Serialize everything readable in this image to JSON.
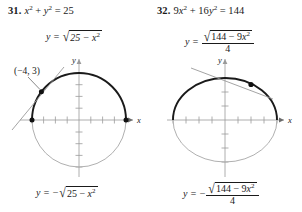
{
  "page": {
    "background": "#ffffff",
    "ink": "#1a1a1a",
    "muted_curve_color": "#a9a9a9",
    "bold_curve_color": "#1a1a1a"
  },
  "problems": [
    {
      "number": "31.",
      "equation": {
        "lhs_var1": "x",
        "exp1": "2",
        "plus": "+",
        "lhs_var2": "y",
        "exp2": "2",
        "equals": "=",
        "rhs": "25",
        "full": "x² + y² = 25"
      },
      "top_function": {
        "lhs": "y  =",
        "radical_sign": "√",
        "radicand": "25 − x²",
        "full": "y = √(25 − x²)"
      },
      "bottom_function": {
        "lhs": "y  =",
        "minus": "−",
        "radical_sign": "√",
        "radicand": "25 − x²",
        "full": "y = −√(25 − x²)"
      },
      "point_label": {
        "open": "(",
        "x": "−4,",
        "y": "3",
        "close": ")",
        "full": "(−4, 3)"
      },
      "axis_labels": {
        "x": "x",
        "y": "y"
      },
      "curve": {
        "type": "circle",
        "radius": 5,
        "center": [
          0,
          0
        ],
        "upper_half": "bold",
        "lower_half": "light",
        "marked_points": [
          [
            -5,
            0
          ],
          [
            5,
            0
          ],
          [
            -4,
            3
          ]
        ],
        "tangent_at": [
          -4,
          3
        ]
      }
    },
    {
      "number": "32.",
      "equation": {
        "coef1": "9",
        "lhs_var1": "x",
        "exp1": "2",
        "plus": "+",
        "coef2": "16",
        "lhs_var2": "y",
        "exp2": "2",
        "equals": "=",
        "rhs": "144",
        "full": "9x² + 16y² = 144"
      },
      "top_function": {
        "lhs": "y  =",
        "radical_sign": "√",
        "radicand": "144 − 9x²",
        "denominator": "4",
        "full": "y = √(144 − 9x²) / 4"
      },
      "bottom_function": {
        "lhs": "y  =",
        "minus": "−",
        "radical_sign": "√",
        "radicand": "144 − 9x²",
        "denominator": "4",
        "full": "y = −√(144 − 9x²) / 4"
      },
      "point_label": {
        "open": "(",
        "x": "2,",
        "num_coef": "3",
        "num_radical": "√",
        "num_radicand": "3",
        "den": "2",
        "close": ")",
        "full": "(2, 3√3/2)"
      },
      "axis_labels": {
        "x": "x",
        "y": "y"
      },
      "curve": {
        "type": "ellipse",
        "semi_axis_x": 4,
        "semi_axis_y": 3,
        "center": [
          0,
          0
        ],
        "upper_half": "bold",
        "lower_half": "light",
        "marked_points": [
          [
            2,
            2.598
          ]
        ],
        "tangent_at": [
          2,
          2.598
        ]
      }
    }
  ]
}
